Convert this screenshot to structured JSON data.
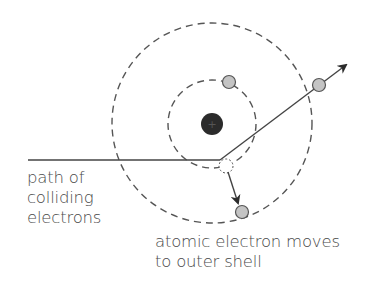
{
  "diagram": {
    "nucleus": {
      "symbol": "+",
      "color": "#2b2b2b"
    },
    "shells": [
      {
        "name": "inner-shell",
        "cx": 212,
        "cy": 124,
        "r": 44
      },
      {
        "name": "outer-shell",
        "cx": 212,
        "cy": 123,
        "r": 100
      }
    ],
    "electron_color": "#c4c4c4",
    "line_color": "#333333",
    "labels": {
      "path": {
        "line1": "path of",
        "line2": "colliding",
        "line3": "electrons"
      },
      "atomic": {
        "line1": "atomic electron moves",
        "line2": "to outer shell"
      }
    }
  }
}
